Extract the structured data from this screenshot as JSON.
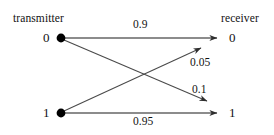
{
  "diagram": {
    "type": "binary-channel-transition-diagram",
    "titles": {
      "left": "transmitter",
      "right": "receiver"
    },
    "nodes": {
      "transmitter": [
        {
          "id": "tx0",
          "label": "0",
          "x": 61,
          "y": 38
        },
        {
          "id": "tx1",
          "label": "1",
          "x": 61,
          "y": 113
        }
      ],
      "receiver": [
        {
          "id": "rx0",
          "label": "0",
          "x": 225,
          "y": 38
        },
        {
          "id": "rx1",
          "label": "1",
          "x": 225,
          "y": 113
        }
      ]
    },
    "edges": [
      {
        "id": "e-00",
        "from": "tx0",
        "to": "rx0",
        "label": "0.9",
        "kind": "correct"
      },
      {
        "id": "e-01",
        "from": "tx0",
        "to": "rx1",
        "label": "0.1",
        "kind": "error"
      },
      {
        "id": "e-10",
        "from": "tx1",
        "to": "rx0",
        "label": "0.05",
        "kind": "error"
      },
      {
        "id": "e-11",
        "from": "tx1",
        "to": "rx1",
        "label": "0.95",
        "kind": "correct"
      }
    ],
    "colors": {
      "line": "#3b3b3b",
      "node_fill": "#000000",
      "text": "#121212",
      "background": "#ffffff"
    }
  }
}
